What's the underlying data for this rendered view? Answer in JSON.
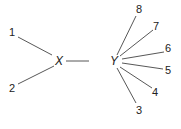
{
  "diagram": {
    "type": "tree",
    "nodes": {
      "X": {
        "label": "X",
        "x": 60,
        "y": 65
      },
      "Y": {
        "label": "Y",
        "x": 115,
        "y": 65
      },
      "n1": {
        "label": "1",
        "x": 13,
        "y": 36
      },
      "n2": {
        "label": "2",
        "x": 13,
        "y": 92
      },
      "n3": {
        "label": "3",
        "x": 139,
        "y": 114
      },
      "n4": {
        "label": "4",
        "x": 156,
        "y": 96
      },
      "n5": {
        "label": "5",
        "x": 169,
        "y": 74
      },
      "n6": {
        "label": "6",
        "x": 169,
        "y": 52
      },
      "n7": {
        "label": "7",
        "x": 157,
        "y": 30
      },
      "n8": {
        "label": "8",
        "x": 140,
        "y": 13
      }
    },
    "edges": [
      [
        "X",
        "n1"
      ],
      [
        "X",
        "n2"
      ],
      [
        "X",
        "Y"
      ],
      [
        "Y",
        "n3"
      ],
      [
        "Y",
        "n4"
      ],
      [
        "Y",
        "n5"
      ],
      [
        "Y",
        "n6"
      ],
      [
        "Y",
        "n7"
      ],
      [
        "Y",
        "n8"
      ]
    ],
    "colors": {
      "line": "#444444",
      "text": "#222222",
      "background": "#ffffff"
    }
  }
}
